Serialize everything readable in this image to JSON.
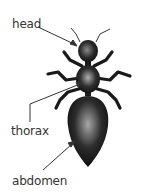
{
  "diagram": {
    "labels": {
      "head": "head",
      "thorax": "thorax",
      "abdomen": "abdomen"
    },
    "colors": {
      "body": "#1a1a1a",
      "highlight": "#9a9a9a",
      "label_text": "#333333",
      "pointer": "#333333",
      "background": "#ffffff"
    }
  }
}
